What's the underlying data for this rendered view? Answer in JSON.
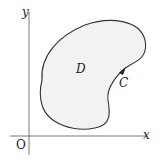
{
  "diagram": {
    "axes": {
      "x_label": "x",
      "y_label": "y",
      "origin_label": "O"
    },
    "region": {
      "label": "D",
      "fill": "#f2f2f2"
    },
    "curve": {
      "label": "C",
      "stroke": "#333333",
      "orientation": "counterclockwise"
    }
  }
}
